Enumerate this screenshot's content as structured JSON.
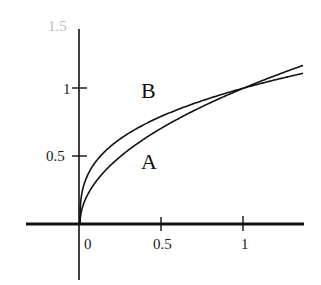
{
  "chart_data": {
    "type": "line",
    "title": "",
    "xlabel": "",
    "ylabel": "",
    "xlim": [
      -0.32,
      1.37
    ],
    "ylim": [
      -0.4,
      1.43
    ],
    "grid": false,
    "legend": "none (curves labeled inline)",
    "x_ticks": [
      "0",
      "0.5",
      "1"
    ],
    "y_ticks": [
      "0.5",
      "1",
      "1.5"
    ],
    "series": [
      {
        "name": "A",
        "formula": "y = x^(1/2)",
        "x": [
          0,
          0.05,
          0.1,
          0.25,
          0.5,
          0.75,
          1,
          1.25,
          1.36
        ],
        "values": [
          0,
          0.224,
          0.316,
          0.5,
          0.707,
          0.866,
          1,
          1.118,
          1.166
        ]
      },
      {
        "name": "B",
        "formula": "y = x^(1/3)",
        "x": [
          0,
          0.05,
          0.1,
          0.25,
          0.5,
          0.75,
          1,
          1.25,
          1.36
        ],
        "values": [
          0,
          0.368,
          0.464,
          0.63,
          0.794,
          0.909,
          1,
          1.077,
          1.108
        ]
      }
    ],
    "annotations": [
      {
        "text": "B",
        "x": 0.45,
        "y": 0.95
      },
      {
        "text": "A",
        "x": 0.45,
        "y": 0.42
      }
    ]
  },
  "labels": {
    "x_tick_0": "0",
    "x_tick_05": "0.5",
    "x_tick_1": "1",
    "y_tick_05": "0.5",
    "y_tick_1": "1",
    "y_tick_15": "1.5",
    "curve_a": "A",
    "curve_b": "B"
  },
  "colors": {
    "ink": "#111111",
    "background": "#ffffff"
  }
}
